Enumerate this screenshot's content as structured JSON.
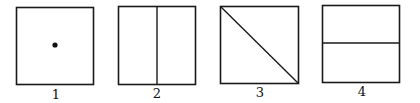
{
  "figures": [
    {
      "label": "1",
      "content": "center-dot"
    },
    {
      "label": "2",
      "content": "vertical-split"
    },
    {
      "label": "3",
      "content": "diagonal-split"
    },
    {
      "label": "4",
      "content": "horizontal-split"
    }
  ],
  "colors": {
    "stroke": "#1a1a1a",
    "background": "#ffffff"
  }
}
